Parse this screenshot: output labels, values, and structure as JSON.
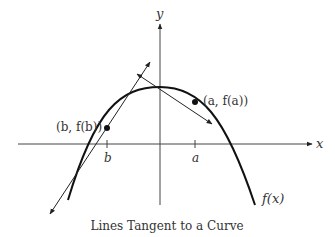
{
  "axes": {
    "x_label": "x",
    "y_label": "y"
  },
  "curve": {
    "label": "f(x)",
    "shape": "downward parabola"
  },
  "points": [
    {
      "name": "a",
      "label": "(a, f(a))",
      "tick_label": "a"
    },
    {
      "name": "b",
      "label": "(b, f(b))",
      "tick_label": "b"
    }
  ],
  "caption": "Lines Tangent to a Curve",
  "colors": {
    "stroke": "#222222",
    "text": "#333333",
    "background": "#ffffff"
  }
}
